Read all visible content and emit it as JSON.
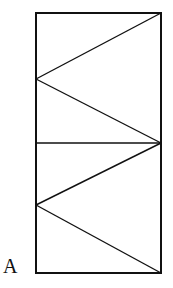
{
  "diagram": {
    "type": "geometry-figure",
    "label": "A",
    "stroke_color": "#111111",
    "background": "#ffffff",
    "rectangle": {
      "x1": 36,
      "y1": 13,
      "x2": 161,
      "y2": 273
    },
    "midline_y": 143,
    "upper_apex": {
      "x": 36,
      "y": 79
    },
    "lower_apex": {
      "x": 36,
      "y": 205
    }
  }
}
